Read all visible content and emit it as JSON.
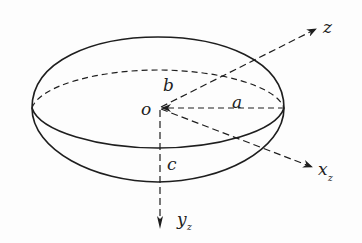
{
  "diagram": {
    "type": "ellipsoid-coordinate-diagram",
    "labels": {
      "origin": "o",
      "semi_axis_a": "a",
      "semi_axis_b": "b",
      "semi_axis_c": "c",
      "axis_z": "z",
      "axis_x": "x",
      "axis_x_sub": "z",
      "axis_y": "y",
      "axis_y_sub": "z"
    },
    "colors": {
      "stroke": "#1e1e1e",
      "background": "#fdfdfd"
    }
  }
}
